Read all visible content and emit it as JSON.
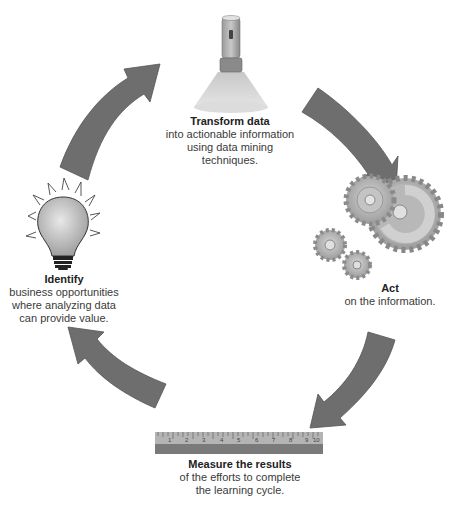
{
  "diagram": {
    "type": "cycle",
    "colors": {
      "arrow": "#6e6e6e",
      "arrow_stroke": "#555555",
      "icon_gray": "#a8a8a8",
      "ruler_top": "#b4b4b4",
      "ruler_bottom": "#7a7a7a",
      "text": "#333333"
    },
    "steps": [
      {
        "id": "transform",
        "icon": "flashlight-icon",
        "title": "Transform data",
        "lines": [
          "into actionable information",
          "using data mining techniques."
        ]
      },
      {
        "id": "act",
        "icon": "gears-icon",
        "title": "Act",
        "lines": [
          "on the information."
        ]
      },
      {
        "id": "measure",
        "icon": "ruler-icon",
        "title": "Measure the results",
        "lines": [
          "of the efforts to complete",
          "the learning cycle."
        ]
      },
      {
        "id": "identify",
        "icon": "lightbulb-icon",
        "title": "Identify",
        "lines": [
          "business opportunities",
          "where analyzing data",
          "can provide value."
        ]
      }
    ],
    "ruler": {
      "labels": [
        "1",
        "2",
        "3",
        "4",
        "5",
        "6",
        "7",
        "8",
        "9",
        "10"
      ]
    },
    "arrows": [
      {
        "from": "identify",
        "to": "transform"
      },
      {
        "from": "transform",
        "to": "act"
      },
      {
        "from": "act",
        "to": "measure"
      },
      {
        "from": "measure",
        "to": "identify"
      }
    ]
  }
}
